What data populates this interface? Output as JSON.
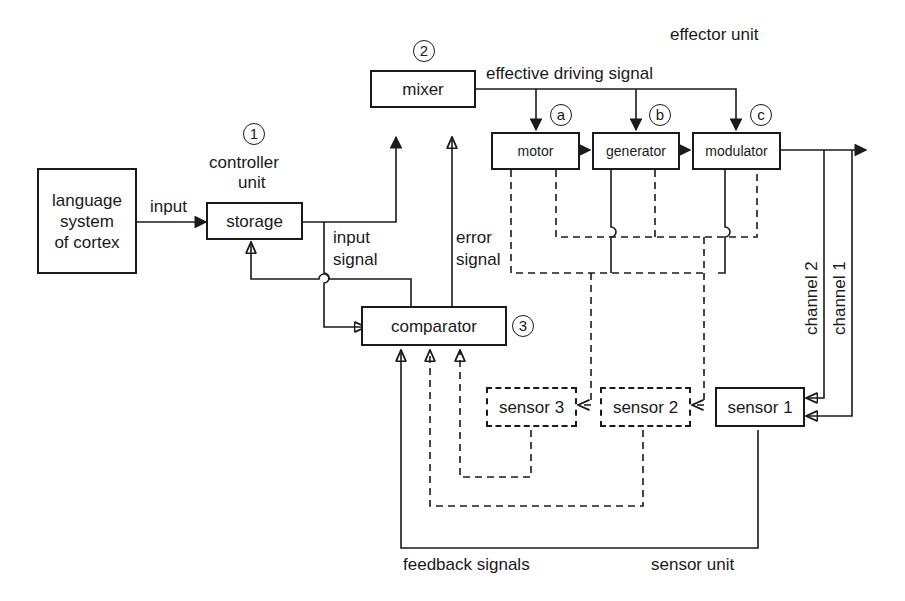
{
  "diagram": {
    "boxes": {
      "language": "language\nsystem\nof cortex",
      "storage": "storage",
      "mixer": "mixer",
      "comparator": "comparator",
      "motor": "motor",
      "generator": "generator",
      "modulator": "modulator",
      "sensor1": "sensor 1",
      "sensor2": "sensor 2",
      "sensor3": "sensor 3"
    },
    "numbers": {
      "controller": "1",
      "mixer": "2",
      "comparator": "3",
      "motor": "a",
      "generator": "b",
      "modulator": "c"
    },
    "labels": {
      "input": "input",
      "controller_unit_1": "controller",
      "controller_unit_2": "unit",
      "input_signal_1": "input",
      "input_signal_2": "signal",
      "error_signal_1": "error",
      "error_signal_2": "signal",
      "effective_driving_signal": "effective driving signal",
      "effector_unit": "effector unit",
      "channel_2": "channel 2",
      "channel_1": "channel 1",
      "feedback_signals": "feedback signals",
      "sensor_unit": "sensor unit"
    },
    "colors": {
      "ink": "#1a1a1a",
      "background": "#ffffff"
    }
  }
}
